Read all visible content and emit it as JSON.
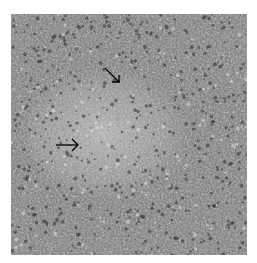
{
  "figure": {
    "arrows": [
      {
        "name": "arrow-upper",
        "direction": "down-right"
      },
      {
        "name": "arrow-left",
        "direction": "right"
      }
    ],
    "colors": {
      "background": "#ffffff",
      "tissue_dark": "#3a3a3a",
      "tissue_mid": "#7a7a7a",
      "tissue_light": "#b5b5b5",
      "arrow": "#000000"
    }
  }
}
